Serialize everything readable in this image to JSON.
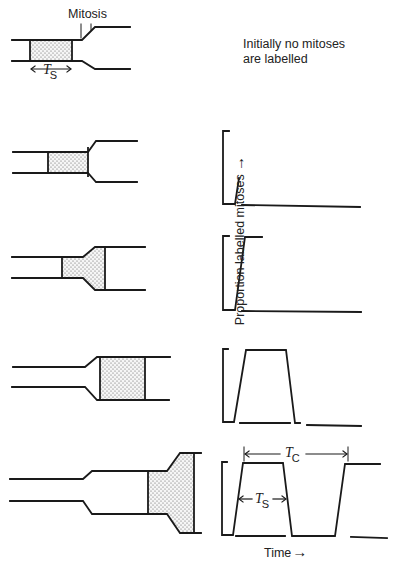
{
  "header": {
    "initial_note_line1": "Initially no mitoses",
    "initial_note_line2": "are labelled",
    "mitosis_label": "Mitosis"
  },
  "axes": {
    "y_label": "Proportion labelled mitoses",
    "y_arrow": "→",
    "x_label": "Time",
    "x_arrow": "→"
  },
  "symbols": {
    "ts_main": "T",
    "ts_sub": "S",
    "tc_main": "T",
    "tc_sub": "C",
    "double_arrow_left": "←",
    "double_arrow_right": "→"
  },
  "stages": [
    {
      "id": 0,
      "description": "Labelled S-phase cohort approaching mitosis; initially no mitoses labelled",
      "plot": "none"
    },
    {
      "id": 1,
      "description": "Labelled cohort reaches mitosis",
      "plot": "rise-begins"
    },
    {
      "id": 2,
      "description": "Labelled cohort entering mitosis",
      "plot": "rise-to-plateau"
    },
    {
      "id": 3,
      "description": "Labelled cohort passes through mitosis",
      "plot": "single-peak"
    },
    {
      "id": 4,
      "description": "Labelled cells return to mitosis in next cycle",
      "plot": "two-peaks",
      "annotations": [
        "T_S",
        "T_C"
      ]
    }
  ],
  "colors": {
    "line": "#1a1a1a",
    "stipple_bg": "#f4f4f4",
    "stipple_dot": "#555555"
  }
}
